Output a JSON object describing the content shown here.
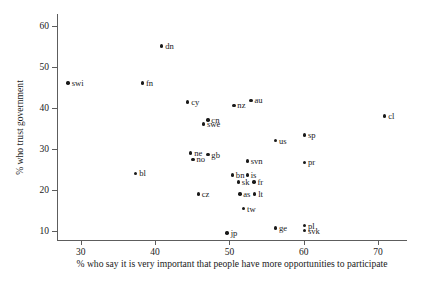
{
  "chart_data": {
    "type": "scatter",
    "title": "",
    "xlabel": "% who say it is very important that people have more opportunities to participate",
    "ylabel": "% who trust government",
    "xlim": [
      26.8,
      73.9
    ],
    "ylim": [
      7.8,
      62.8
    ],
    "xticks": [
      30,
      40,
      50,
      60,
      70
    ],
    "yticks": [
      10,
      20,
      30,
      40,
      50,
      60
    ],
    "grid": false,
    "legend": "none",
    "marker_color": "#1a1a1a",
    "axis_color": "#5d5d5d",
    "points": [
      {
        "label": "swi",
        "x": 28.3,
        "y": 46.0
      },
      {
        "label": "dn",
        "x": 40.9,
        "y": 55.0
      },
      {
        "label": "fn",
        "x": 38.3,
        "y": 46.0
      },
      {
        "label": "cy",
        "x": 44.4,
        "y": 41.4
      },
      {
        "label": "nz",
        "x": 50.6,
        "y": 40.6
      },
      {
        "label": "au",
        "x": 52.9,
        "y": 41.8
      },
      {
        "label": "cl",
        "x": 70.9,
        "y": 38.0
      },
      {
        "label": "cn",
        "x": 47.1,
        "y": 37.0
      },
      {
        "label": "swe",
        "x": 46.5,
        "y": 36.0
      },
      {
        "label": "us",
        "x": 56.2,
        "y": 32.0
      },
      {
        "label": "sp",
        "x": 60.1,
        "y": 33.4
      },
      {
        "label": "ne",
        "x": 44.8,
        "y": 29.0
      },
      {
        "label": "gb",
        "x": 47.1,
        "y": 28.6
      },
      {
        "label": "no",
        "x": 45.1,
        "y": 27.4
      },
      {
        "label": "svn",
        "x": 52.4,
        "y": 27.0
      },
      {
        "label": "pr",
        "x": 60.1,
        "y": 26.7
      },
      {
        "label": "bl",
        "x": 37.4,
        "y": 24.0
      },
      {
        "label": "bn",
        "x": 50.4,
        "y": 23.6
      },
      {
        "label": "is",
        "x": 52.4,
        "y": 23.6
      },
      {
        "label": "sk",
        "x": 51.2,
        "y": 21.9
      },
      {
        "label": "fr",
        "x": 53.3,
        "y": 21.9
      },
      {
        "label": "cz",
        "x": 45.8,
        "y": 19.0
      },
      {
        "label": "as",
        "x": 51.4,
        "y": 19.0
      },
      {
        "label": "lt",
        "x": 53.4,
        "y": 19.0
      },
      {
        "label": "tw",
        "x": 51.9,
        "y": 15.4
      },
      {
        "label": "jp",
        "x": 49.7,
        "y": 9.5
      },
      {
        "label": "ge",
        "x": 56.2,
        "y": 10.7
      },
      {
        "label": "pl",
        "x": 60.1,
        "y": 11.3
      },
      {
        "label": "svk",
        "x": 60.1,
        "y": 10.1
      }
    ]
  }
}
